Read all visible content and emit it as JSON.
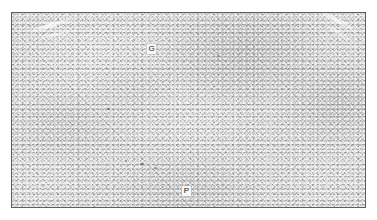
{
  "figure": {
    "type": "grayscale-light-micrograph",
    "frame": {
      "border_color": "#5d5d5d",
      "background_color": "#ffffff",
      "left": 11,
      "top": 12,
      "width": 355,
      "height": 196
    },
    "tissue": {
      "base_color": "#e2e2e2",
      "speckle_dark_color": "#787878",
      "speckle_light_color": "#ffffff",
      "dense_zone_color": "#6e6e6e",
      "pale_streak_color": "#ffffff",
      "debris_color": "#5a5a5a"
    },
    "labels": [
      {
        "id": "label-g",
        "text": "G",
        "meaning": "germinal-center-region",
        "x": 135,
        "y": 31,
        "chip_background": "#f7f7f7",
        "text_color": "#1a1a1a"
      },
      {
        "id": "label-p",
        "text": "P",
        "meaning": "parenchyma-region",
        "x": 170,
        "y": 173,
        "chip_background": "#f7f7f7",
        "text_color": "#1a1a1a"
      }
    ]
  }
}
